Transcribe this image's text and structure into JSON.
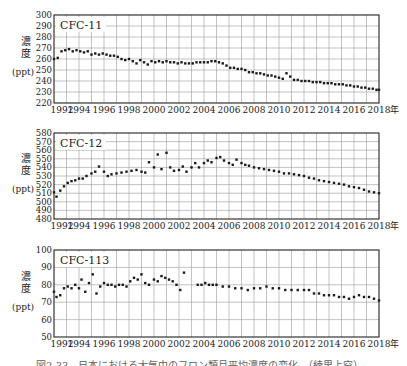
{
  "figure": {
    "caption": "図2-33　日本における大気中のフロン類月平均濃度の変化　（綾里上空）",
    "x_unit_suffix": "年",
    "y_label_chars": [
      "濃",
      "度"
    ],
    "y_unit": "(ppt)"
  },
  "chart_data": [
    {
      "type": "scatter",
      "title": "CFC-11",
      "xlabel": "年",
      "ylabel": "濃度 (ppt)",
      "xlim": [
        1992,
        2018
      ],
      "ylim": [
        220,
        300
      ],
      "yticks": [
        220,
        230,
        240,
        250,
        260,
        270,
        280,
        290,
        300
      ],
      "xticks": [
        1992,
        1994,
        1996,
        1998,
        2000,
        2002,
        2004,
        2006,
        2008,
        2010,
        2012,
        2014,
        2016,
        2018
      ],
      "grid": true,
      "x": [
        1992.0,
        1992.3,
        1992.6,
        1992.9,
        1993.2,
        1993.5,
        1993.8,
        1994.1,
        1994.4,
        1994.7,
        1995.0,
        1995.3,
        1995.6,
        1995.9,
        1996.2,
        1996.5,
        1996.8,
        1997.1,
        1997.4,
        1997.7,
        1998.0,
        1998.3,
        1998.6,
        1998.9,
        1999.2,
        1999.5,
        1999.8,
        2000.1,
        2000.4,
        2000.7,
        2001.0,
        2001.3,
        2001.6,
        2001.9,
        2002.2,
        2002.5,
        2002.8,
        2003.1,
        2003.4,
        2003.7,
        2004.0,
        2004.3,
        2004.6,
        2004.9,
        2005.2,
        2005.5,
        2005.8,
        2006.1,
        2006.4,
        2006.7,
        2007.0,
        2007.3,
        2007.6,
        2007.9,
        2008.2,
        2008.5,
        2008.8,
        2009.1,
        2009.4,
        2009.7,
        2010.0,
        2010.3,
        2010.6,
        2010.9,
        2011.2,
        2011.5,
        2011.8,
        2012.1,
        2012.4,
        2012.7,
        2013.0,
        2013.3,
        2013.6,
        2013.9,
        2014.2,
        2014.5,
        2014.8,
        2015.1,
        2015.4,
        2015.7,
        2016.0,
        2016.3,
        2016.6,
        2016.9,
        2017.2,
        2017.5,
        2017.8,
        2018.0
      ],
      "values": [
        260,
        261,
        267,
        268,
        269,
        267,
        268,
        267,
        266,
        267,
        264,
        265,
        264,
        265,
        264,
        263,
        263,
        262,
        260,
        259,
        260,
        258,
        256,
        259,
        257,
        255,
        258,
        257,
        258,
        257,
        258,
        257,
        257,
        256,
        257,
        256,
        256,
        256,
        257,
        257,
        257,
        257,
        258,
        258,
        257,
        256,
        254,
        252,
        252,
        251,
        251,
        250,
        248,
        248,
        247,
        247,
        246,
        245,
        245,
        244,
        243,
        242,
        247,
        244,
        241,
        241,
        240,
        240,
        240,
        239,
        239,
        239,
        238,
        238,
        238,
        237,
        237,
        237,
        236,
        236,
        235,
        235,
        234,
        234,
        233,
        233,
        232,
        232
      ]
    },
    {
      "type": "scatter",
      "title": "CFC-12",
      "xlabel": "年",
      "ylabel": "濃度 (ppt)",
      "xlim": [
        1992,
        2018
      ],
      "ylim": [
        480,
        580
      ],
      "yticks": [
        480,
        490,
        500,
        510,
        520,
        530,
        540,
        550,
        560,
        570,
        580
      ],
      "xticks": [
        1992,
        1994,
        1996,
        1998,
        2000,
        2002,
        2004,
        2006,
        2008,
        2010,
        2012,
        2014,
        2016,
        2018
      ],
      "grid": true,
      "x": [
        1992.0,
        1992.2,
        1992.5,
        1992.8,
        1993.1,
        1993.4,
        1993.7,
        1994.0,
        1994.3,
        1994.6,
        1995.0,
        1995.3,
        1995.6,
        1996.0,
        1996.3,
        1996.6,
        1997.0,
        1997.4,
        1997.8,
        1998.2,
        1998.6,
        1999.0,
        1999.3,
        1999.6,
        2000.0,
        2000.3,
        2000.6,
        2001.0,
        2001.3,
        2001.6,
        2002.0,
        2002.3,
        2002.6,
        2003.0,
        2003.3,
        2003.6,
        2004.0,
        2004.3,
        2004.6,
        2005.0,
        2005.3,
        2005.6,
        2006.0,
        2006.3,
        2006.6,
        2007.0,
        2007.3,
        2007.6,
        2008.0,
        2008.4,
        2008.8,
        2009.2,
        2009.6,
        2010.0,
        2010.4,
        2010.8,
        2011.2,
        2011.6,
        2012.0,
        2012.4,
        2012.8,
        2013.2,
        2013.6,
        2014.0,
        2014.4,
        2014.8,
        2015.2,
        2015.6,
        2016.0,
        2016.4,
        2016.8,
        2017.2,
        2017.6,
        2018.0
      ],
      "values": [
        511,
        506,
        513,
        518,
        522,
        524,
        525,
        527,
        527,
        530,
        533,
        535,
        541,
        535,
        530,
        532,
        533,
        534,
        535,
        536,
        537,
        535,
        534,
        546,
        540,
        555,
        538,
        557,
        540,
        536,
        537,
        541,
        535,
        540,
        545,
        540,
        545,
        548,
        546,
        551,
        552,
        548,
        545,
        543,
        549,
        545,
        543,
        542,
        540,
        539,
        538,
        537,
        536,
        535,
        533,
        533,
        532,
        531,
        530,
        528,
        527,
        525,
        524,
        523,
        522,
        521,
        520,
        518,
        517,
        516,
        514,
        512,
        511,
        510
      ]
    },
    {
      "type": "scatter",
      "title": "CFC-113",
      "xlabel": "年",
      "ylabel": "濃度 (ppt)",
      "xlim": [
        1992,
        2018
      ],
      "ylim": [
        50,
        100
      ],
      "yticks": [
        50,
        60,
        70,
        80,
        90,
        100
      ],
      "xticks": [
        1992,
        1994,
        1996,
        1998,
        2000,
        2002,
        2004,
        2006,
        2008,
        2010,
        2012,
        2014,
        2016,
        2018
      ],
      "grid": true,
      "x": [
        1992.0,
        1992.2,
        1992.5,
        1992.8,
        1993.1,
        1993.4,
        1993.7,
        1994.0,
        1994.2,
        1994.5,
        1994.8,
        1995.1,
        1995.4,
        1995.7,
        1996.0,
        1996.3,
        1996.6,
        1996.9,
        1997.2,
        1997.5,
        1997.8,
        1998.1,
        1998.4,
        1998.7,
        1999.0,
        1999.3,
        1999.6,
        2000.0,
        2000.3,
        2000.6,
        2000.9,
        2001.2,
        2001.5,
        2001.8,
        2002.1,
        2002.4,
        2003.5,
        2003.8,
        2004.1,
        2004.4,
        2004.7,
        2005.0,
        2005.5,
        2006.0,
        2006.5,
        2007.0,
        2007.5,
        2008.0,
        2008.5,
        2009.0,
        2009.5,
        2010.0,
        2010.5,
        2011.0,
        2011.5,
        2012.0,
        2012.4,
        2012.8,
        2013.2,
        2013.6,
        2014.0,
        2014.4,
        2014.8,
        2015.2,
        2015.6,
        2016.0,
        2016.4,
        2016.8,
        2017.2,
        2017.6,
        2018.0
      ],
      "values": [
        76,
        73,
        74,
        78,
        79,
        78,
        80,
        78,
        83,
        76,
        81,
        86,
        75,
        79,
        81,
        80,
        80,
        79,
        80,
        80,
        79,
        82,
        84,
        83,
        86,
        81,
        80,
        83,
        82,
        85,
        84,
        83,
        82,
        80,
        77,
        87,
        80,
        80,
        81,
        80,
        80,
        80,
        79,
        79,
        78,
        78,
        77,
        78,
        78,
        79,
        78,
        78,
        77,
        77,
        77,
        77,
        77,
        75,
        75,
        74,
        74,
        74,
        73,
        73,
        72,
        73,
        74,
        73,
        73,
        72,
        71
      ]
    }
  ],
  "layout": {
    "plots": [
      {
        "left": 54,
        "top": 15,
        "right": 379,
        "bottom": 103
      },
      {
        "left": 54,
        "top": 133,
        "right": 379,
        "bottom": 219
      },
      {
        "left": 54,
        "top": 250,
        "right": 379,
        "bottom": 337
      }
    ]
  },
  "colors": {
    "axis": "#222222",
    "grid": "#9a9a9a",
    "marker": "#1a1a1a",
    "text": "#222222"
  }
}
